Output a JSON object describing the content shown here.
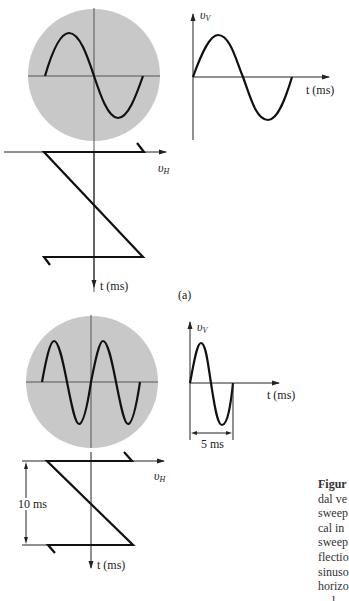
{
  "figure": {
    "panel_a": {
      "label": "(a)",
      "scope_screen": {
        "waveform": "sine",
        "cycles": 1,
        "fill_color": "#c8c8c8"
      },
      "vertical_input_plot": {
        "y_axis_label": "υ",
        "y_axis_sub": "V",
        "x_axis_label": "t (ms)",
        "waveform": "sine",
        "cycles": 1
      },
      "sweep_plot": {
        "h_axis_label": "υ",
        "h_axis_sub": "H",
        "t_axis_label": "t (ms)",
        "waveform": "sawtooth"
      }
    },
    "panel_b": {
      "scope_screen": {
        "waveform": "sine",
        "cycles": 2,
        "fill_color": "#c8c8c8"
      },
      "vertical_input_plot": {
        "y_axis_label": "υ",
        "y_axis_sub": "V",
        "x_axis_label": "t (ms)",
        "period_label": "5 ms",
        "waveform": "sine",
        "cycles": 1
      },
      "sweep_plot": {
        "h_axis_label": "υ",
        "h_axis_sub": "H",
        "t_axis_label": "t (ms)",
        "period_label": "10 ms",
        "waveform": "sawtooth"
      }
    },
    "caption": {
      "title": "Figur",
      "lines": [
        "dal ve",
        "sweep",
        "cal in",
        "sweep",
        "flectio",
        "sinuso",
        "horizo",
        "- - l -"
      ]
    }
  }
}
